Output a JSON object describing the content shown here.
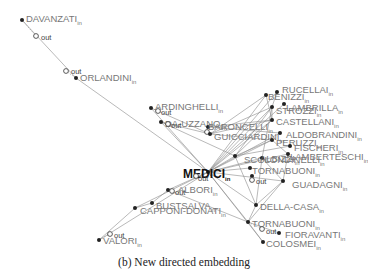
{
  "caption": "(b) New directed embedding",
  "suffix_in": "in",
  "suffix_out": "out",
  "nodes": [
    {
      "id": "DAVANZATI",
      "x": 22,
      "y": 20,
      "lx": 26,
      "ly": 19,
      "ox": 36,
      "oy": 36,
      "olx": 41,
      "oly": 38
    },
    {
      "id": "ORLANDINI",
      "x": 76,
      "y": 78,
      "lx": 80,
      "ly": 78,
      "ox": 66,
      "oy": 71,
      "olx": 71,
      "oly": 72
    },
    {
      "id": "ARDINGHELLI",
      "x": 151,
      "y": 108,
      "lx": 155,
      "ly": 107,
      "ox": 158,
      "oy": 111,
      "olx": 161,
      "oly": 113
    },
    {
      "id": "DA-UZZANO",
      "x": 161,
      "y": 122,
      "lx": 165,
      "ly": 124,
      "ox": 168,
      "oy": 124,
      "olx": 171,
      "oly": 126
    },
    {
      "id": "BARONCELLI",
      "x": 208,
      "y": 127,
      "lx": 208,
      "ly": 127,
      "ox": 207,
      "oy": 132,
      "olx": 0,
      "oly": 0
    },
    {
      "id": "GUICCIARDINI",
      "x": 210,
      "y": 134,
      "lx": 214,
      "ly": 137,
      "ox": 0,
      "oy": 0,
      "olx": 0,
      "oly": 0
    },
    {
      "id": "RUCELLAI",
      "x": 277,
      "y": 92,
      "lx": 282,
      "ly": 90,
      "ox": 0,
      "oy": 0,
      "olx": 0,
      "oly": 0
    },
    {
      "id": "BENIZZI",
      "x": 266,
      "y": 95,
      "lx": 268,
      "ly": 97,
      "ox": 0,
      "oy": 0,
      "olx": 0,
      "oly": 0
    },
    {
      "id": "LAMBRILLA",
      "x": 284,
      "y": 104,
      "lx": 286,
      "ly": 108,
      "ox": 0,
      "oy": 0,
      "olx": 0,
      "oly": 0
    },
    {
      "id": "STROZZI",
      "x": 272,
      "y": 107,
      "lx": 276,
      "ly": 111,
      "ox": 0,
      "oy": 0,
      "olx": 0,
      "oly": 0
    },
    {
      "id": "CASTELLANI",
      "x": 272,
      "y": 120,
      "lx": 276,
      "ly": 122,
      "ox": 0,
      "oy": 0,
      "olx": 0,
      "oly": 0
    },
    {
      "id": "ALDOBRANDINI",
      "x": 280,
      "y": 133,
      "lx": 286,
      "ly": 135,
      "ox": 0,
      "oy": 0,
      "olx": 0,
      "oly": 0
    },
    {
      "id": "PERUZZI",
      "x": 272,
      "y": 140,
      "lx": 276,
      "ly": 143,
      "ox": 0,
      "oy": 0,
      "olx": 0,
      "oly": 0
    },
    {
      "id": "FISCHERI",
      "x": 290,
      "y": 146,
      "lx": 294,
      "ly": 148,
      "ox": 0,
      "oy": 0,
      "olx": 0,
      "oly": 0
    },
    {
      "id": "LAMBERTESCHI",
      "x": 288,
      "y": 154,
      "lx": 290,
      "ly": 157,
      "ox": 0,
      "oy": 0,
      "olx": 0,
      "oly": 0
    },
    {
      "id": "SCOLONDINELLI",
      "x": 235,
      "y": 156,
      "lx": 244,
      "ly": 160,
      "ox": 0,
      "oy": 0,
      "olx": 0,
      "oly": 0
    },
    {
      "id": "ALBIZZI",
      "x": 262,
      "y": 158,
      "lx": 260,
      "ly": 159,
      "ox": 0,
      "oy": 0,
      "olx": 0,
      "oly": 0
    },
    {
      "id": "TORNABUONI",
      "x": 250,
      "y": 168,
      "lx": 252,
      "ly": 171,
      "ox": 0,
      "oy": 0,
      "olx": 0,
      "oly": 0
    },
    {
      "id": "MEDICI",
      "x": 208,
      "y": 172,
      "lx": 183,
      "ly": 175,
      "ox": 196,
      "oy": 176,
      "olx": 198,
      "oly": 179
    },
    {
      "id": "GUADAGNI",
      "x": 283,
      "y": 181,
      "lx": 292,
      "ly": 185,
      "ox": 0,
      "oy": 0,
      "olx": 0,
      "oly": 0
    },
    {
      "id": "PAZZI",
      "x": 252,
      "y": 176,
      "lx": 0,
      "ly": 0,
      "ox": 252,
      "oy": 180,
      "olx": 256,
      "oly": 182
    },
    {
      "id": "ALBORI",
      "x": 168,
      "y": 190,
      "lx": 178,
      "ly": 190,
      "ox": 172,
      "oy": 191,
      "olx": 175,
      "oly": 193
    },
    {
      "id": "BUSTSALVA",
      "x": 152,
      "y": 203,
      "lx": 156,
      "ly": 206,
      "ox": 0,
      "oy": 0,
      "olx": 0,
      "oly": 0
    },
    {
      "id": "CAPPONI-DONATI",
      "x": 135,
      "y": 208,
      "lx": 140,
      "ly": 211,
      "ox": 0,
      "oy": 0,
      "olx": 0,
      "oly": 0
    },
    {
      "id": "DELLA-CASA",
      "x": 256,
      "y": 205,
      "lx": 260,
      "ly": 207,
      "ox": 0,
      "oy": 0,
      "olx": 0,
      "oly": 0
    },
    {
      "id": "VALORI",
      "x": 99,
      "y": 240,
      "lx": 103,
      "ly": 241,
      "ox": 110,
      "oy": 234,
      "olx": 114,
      "oly": 236
    },
    {
      "id": "TORNABUONI2",
      "x": 248,
      "y": 222,
      "lx": 252,
      "ly": 224,
      "ox": 262,
      "oy": 229,
      "olx": 266,
      "oly": 232
    },
    {
      "id": "FIORAVANTI",
      "x": 279,
      "y": 233,
      "lx": 285,
      "ly": 235,
      "ox": 0,
      "oy": 0,
      "olx": 0,
      "oly": 0
    },
    {
      "id": "COLOSMEI",
      "x": 263,
      "y": 242,
      "lx": 266,
      "ly": 244,
      "ox": 0,
      "oy": 0,
      "olx": 0,
      "oly": 0
    }
  ],
  "labels": {
    "DAVANZATI": "DAVANZATI",
    "ORLANDINI": "ORLANDINI",
    "ARDINGHELLI": "ARDINGHELLI",
    "DA-UZZANO": "DA-UZZANO",
    "BARONCELLI": "BARONCELLI",
    "GUICCIARDINI": "GUICCIARDINI",
    "RUCELLAI": "RUCELLAI",
    "BENIZZI": "BENIZZI",
    "LAMBRILLA": "LAMBRILLA",
    "STROZZI": "STROZZI",
    "CASTELLANI": "CASTELLANI",
    "ALDOBRANDINI": "ALDOBRANDINI",
    "PERUZZI": "PERUZZI",
    "FISCHERI": "FISCHERI",
    "LAMBERTESCHI": "LAMBERTESCHI",
    "SCOLONDINELLI": "SCOLONDINELLI",
    "ALBIZZI": "ALBIZZI",
    "TORNABUONI": "TORNABUONI",
    "MEDICI": "MEDICI",
    "GUADAGNI": "GUADAGNI",
    "ALBORI": "ALBORI",
    "BUSTSALVA": "BUSTSALVA",
    "CAPPONI-DONATI": "CAPPONI-DONATI",
    "DELLA-CASA": "DELLA-CASA",
    "VALORI": "VALORI",
    "TORNABUONI2": "TORNABUONI",
    "FIORAVANTI": "FIORAVANTI",
    "COLOSMEI": "COLOSMEI"
  },
  "edges": [
    [
      "DAVANZATI",
      "ORLANDINI"
    ],
    [
      "ORLANDINI",
      "MEDICI"
    ],
    [
      "ARDINGHELLI",
      "MEDICI"
    ],
    [
      "ARDINGHELLI",
      "GUICCIARDINI"
    ],
    [
      "DA-UZZANO",
      "MEDICI"
    ],
    [
      "DA-UZZANO",
      "GUICCIARDINI"
    ],
    [
      "DA-UZZANO",
      "SCOLONDINELLI"
    ],
    [
      "MEDICI",
      "BENIZZI"
    ],
    [
      "MEDICI",
      "STROZZI"
    ],
    [
      "MEDICI",
      "CASTELLANI"
    ],
    [
      "MEDICI",
      "ALDOBRANDINI"
    ],
    [
      "MEDICI",
      "PERUZZI"
    ],
    [
      "MEDICI",
      "LAMBERTESCHI"
    ],
    [
      "MEDICI",
      "GUADAGNI"
    ],
    [
      "MEDICI",
      "ALBIZZI"
    ],
    [
      "MEDICI",
      "TORNABUONI"
    ],
    [
      "MEDICI",
      "SCOLONDINELLI"
    ],
    [
      "MEDICI",
      "DELLA-CASA"
    ],
    [
      "MEDICI",
      "TORNABUONI2"
    ],
    [
      "MEDICI",
      "RUCELLAI"
    ],
    [
      "MEDICI",
      "LAMBRILLA"
    ],
    [
      "GUICCIARDINI",
      "BENIZZI"
    ],
    [
      "GUICCIARDINI",
      "STROZZI"
    ],
    [
      "GUICCIARDINI",
      "CASTELLANI"
    ],
    [
      "GUICCIARDINI",
      "PERUZZI"
    ],
    [
      "BARONCELLI",
      "CASTELLANI"
    ],
    [
      "BARONCELLI",
      "ALDOBRANDINI"
    ],
    [
      "SCOLONDINELLI",
      "PERUZZI"
    ],
    [
      "SCOLONDINELLI",
      "STROZZI"
    ],
    [
      "SCOLONDINELLI",
      "CASTELLANI"
    ],
    [
      "SCOLONDINELLI",
      "FISCHERI"
    ],
    [
      "ALBIZZI",
      "GUADAGNI"
    ],
    [
      "ALBIZZI",
      "DELLA-CASA"
    ],
    [
      "ALBIZZI",
      "STROZZI"
    ],
    [
      "PERUZZI",
      "LAMBERTESCHI"
    ],
    [
      "STROZZI",
      "RUCELLAI"
    ],
    [
      "STROZZI",
      "CASTELLANI"
    ],
    [
      "BENIZZI",
      "CASTELLANI"
    ],
    [
      "GUADAGNI",
      "DELLA-CASA"
    ],
    [
      "GUADAGNI",
      "TORNABUONI2"
    ],
    [
      "GUADAGNI",
      "LAMBERTESCHI"
    ],
    [
      "DELLA-CASA",
      "TORNABUONI2"
    ],
    [
      "DELLA-CASA",
      "SCOLONDINELLI"
    ],
    [
      "TORNABUONI2",
      "COLOSMEI"
    ],
    [
      "TORNABUONI2",
      "FIORAVANTI"
    ],
    [
      "MEDICI",
      "COLOSMEI"
    ],
    [
      "MEDICI",
      "ALBORI"
    ],
    [
      "ALBORI",
      "BUSTSALVA"
    ],
    [
      "MEDICI",
      "CAPPONI-DONATI"
    ],
    [
      "CAPPONI-DONATI",
      "VALORI"
    ],
    [
      "MEDICI",
      "VALORI"
    ],
    [
      "ALBORI",
      "TORNABUONI2"
    ],
    [
      "BUSTSALVA",
      "CAPPONI-DONATI"
    ]
  ]
}
